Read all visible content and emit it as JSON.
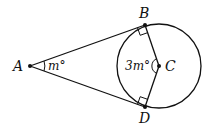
{
  "diagram": {
    "points": {
      "A": {
        "label": "A",
        "x": 30,
        "y": 66
      },
      "B": {
        "label": "B",
        "x": 145,
        "y": 25
      },
      "C": {
        "label": "C",
        "x": 159,
        "y": 66
      },
      "D": {
        "label": "D",
        "x": 145,
        "y": 107
      }
    },
    "circle": {
      "center": "C",
      "radius": 42
    },
    "angles": {
      "A": "m°",
      "C": "3m°"
    },
    "right_angles": [
      "B",
      "D"
    ],
    "stroke_color": "#111111"
  }
}
